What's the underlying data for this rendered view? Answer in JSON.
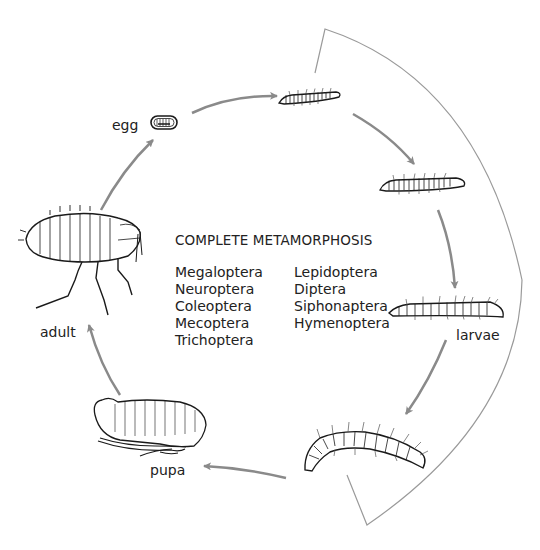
{
  "diagram": {
    "title": "COMPLETE METAMORPHOSIS",
    "stages": {
      "egg": "egg",
      "larvae": "larvae",
      "pupa": "pupa",
      "adult": "adult"
    },
    "orders_column_1": [
      "Megaloptera",
      "Neuroptera",
      "Coleoptera",
      "Mecoptera",
      "Trichoptera"
    ],
    "orders_column_2": [
      "Lepidoptera",
      "Diptera",
      "Siphonaptera",
      "Hymenoptera"
    ],
    "colors": {
      "arrow": "#8a8a8a",
      "bracket": "#9a9a9a",
      "ink": "#1a1a1a"
    }
  }
}
